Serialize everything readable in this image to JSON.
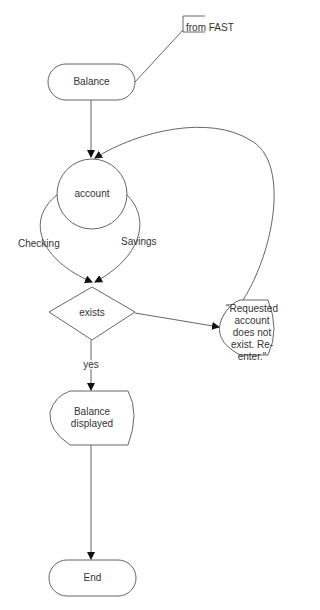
{
  "diagram": {
    "annotation": "from FAST",
    "nodes": {
      "start": "Balance",
      "account": "account",
      "exists": "exists",
      "error": "\"Requested account does not exist. Re-enter.\"",
      "display": "Balance displayed",
      "end": "End"
    },
    "edge_labels": {
      "checking": "Checking",
      "savings": "Savings",
      "yes": "yes"
    },
    "colors": {
      "stroke": "#555555",
      "text": "#333333",
      "background": "#ffffff"
    }
  }
}
